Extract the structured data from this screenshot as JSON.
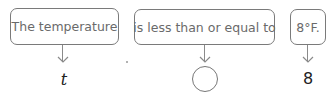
{
  "diagram": {
    "phrases": [
      {
        "text": "The temperature",
        "symbol": "t"
      },
      {
        "text": "is less than or equal to",
        "symbol": ""
      },
      {
        "text": "8°F.",
        "symbol": "8"
      }
    ],
    "colors": {
      "box_border": "#7a7a7a",
      "box_text": "#6a6a6a",
      "symbol_text": "#222222"
    }
  }
}
